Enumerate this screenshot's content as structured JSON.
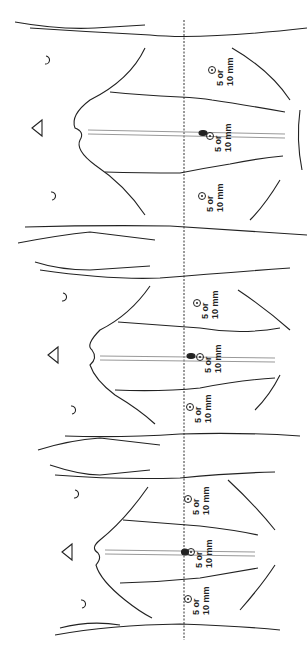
{
  "figure": {
    "panels": [
      {
        "id": "top",
        "y_offset": 0,
        "ports": [
          {
            "pos": "right",
            "x": 212,
            "y": 70,
            "label_line1": "5 or",
            "label_line2": "10 mm"
          },
          {
            "pos": "center",
            "x": 210,
            "y": 136,
            "label_line1": "5 or",
            "label_line2": "10 mm"
          },
          {
            "pos": "left",
            "x": 202,
            "y": 196,
            "label_line1": "5 or",
            "label_line2": "10 mm"
          }
        ]
      },
      {
        "id": "middle",
        "y_offset": 220,
        "ports": [
          {
            "pos": "right",
            "x": 197,
            "y": 303,
            "label_line1": "5 or",
            "label_line2": "10 mm"
          },
          {
            "pos": "center",
            "x": 200,
            "y": 357,
            "label_line1": "5 or",
            "label_line2": "10 mm"
          },
          {
            "pos": "left",
            "x": 190,
            "y": 407,
            "label_line1": "5 or",
            "label_line2": "10 mm"
          }
        ]
      },
      {
        "id": "bottom",
        "y_offset": 430,
        "ports": [
          {
            "pos": "right",
            "x": 188,
            "y": 499,
            "label_line1": "5 or",
            "label_line2": "10 mm"
          },
          {
            "pos": "center",
            "x": 191,
            "y": 552,
            "label_line1": "5 or",
            "label_line2": "10 mm"
          },
          {
            "pos": "left",
            "x": 188,
            "y": 599,
            "label_line1": "5 or",
            "label_line2": "10 mm"
          }
        ]
      }
    ],
    "reference_line": {
      "style": "dashed",
      "x": 184
    },
    "colors": {
      "line": "#222222",
      "background": "#ffffff"
    }
  }
}
